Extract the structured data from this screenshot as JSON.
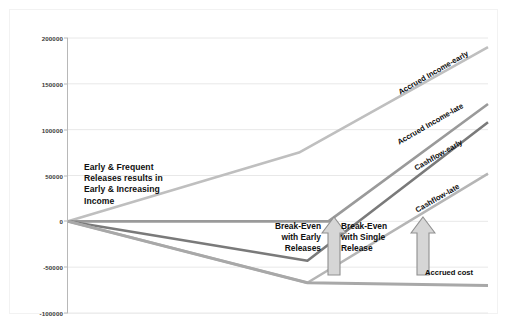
{
  "chart_data": {
    "type": "line",
    "title": "",
    "xlabel": "",
    "ylabel": "",
    "ylim": [
      -100000,
      200000
    ],
    "xlim": [
      0,
      100
    ],
    "grid": true,
    "grid_axis": "y",
    "legend_position": "inline-series-labels",
    "yticks": [
      "200000",
      "150000",
      "100000",
      "50000",
      "0",
      "-50000",
      "-100000"
    ],
    "ytick_values": [
      200000,
      150000,
      100000,
      50000,
      0,
      -50000,
      -100000
    ],
    "series": [
      {
        "name": "Accrued Income-early",
        "color": "#bfbfbf",
        "width": 2.6,
        "x": [
          0,
          55,
          100
        ],
        "values": [
          0,
          75000,
          190000
        ]
      },
      {
        "name": "Accrued Income-late",
        "color": "#9a9a9a",
        "width": 2.6,
        "x": [
          0,
          62,
          100
        ],
        "values": [
          0,
          0,
          128000
        ]
      },
      {
        "name": "Cashflow-early",
        "color": "#7a7a7a",
        "width": 2.6,
        "x": [
          0,
          57,
          100
        ],
        "values": [
          0,
          -43000,
          108000
        ]
      },
      {
        "name": "Cashflow-late",
        "color": "#b5b5b5",
        "width": 2.6,
        "x": [
          0,
          57,
          100
        ],
        "values": [
          0,
          -67000,
          52000
        ]
      },
      {
        "name": "Accrued cost",
        "color": "#a8a8a8",
        "width": 3.0,
        "x": [
          0,
          57,
          100
        ],
        "values": [
          0,
          -67000,
          -70000
        ]
      }
    ],
    "series_labels": [
      {
        "text": "Accrued Income-early",
        "rotation": -30
      },
      {
        "text": "Accrued Income-late",
        "rotation": -30
      },
      {
        "text": "Cashflow-early",
        "rotation": -30
      },
      {
        "text": "Cashflow-late",
        "rotation": -30
      },
      {
        "text": "Accrued cost",
        "rotation": 0
      }
    ],
    "annotations": [
      {
        "text": "Early & Frequent Releases results in Early & Increasing Income"
      },
      {
        "text": "Break-Even with Early Releases"
      },
      {
        "text": "Break-Even with Single Release"
      }
    ]
  },
  "annotation": {
    "line1": "Early & Frequent",
    "line2": "Releases results in",
    "line3": "Early & Increasing",
    "line4": "Income"
  },
  "callouts": {
    "early": {
      "line1": "Break-Even",
      "line2": "with Early",
      "line3": "Releases"
    },
    "single": {
      "line1": "Break-Even",
      "line2": "with Single",
      "line3": "Release"
    }
  },
  "labels": {
    "accrued_income_early": "Accrued Income-early",
    "accrued_income_late": "Accrued Income-late",
    "cashflow_early": "Cashflow-early",
    "cashflow_late": "Cashflow-late",
    "accrued_cost": "Accrued cost"
  },
  "axis": {
    "y0": "200000",
    "y1": "150000",
    "y2": "100000",
    "y3": "50000",
    "y4": "0",
    "y5": "-50000",
    "y6": "-100000"
  },
  "colors": {
    "grid": "#e8e8e8",
    "axis": "#b8b8b8",
    "accrued_income_early": "#bfbfbf",
    "accrued_income_late": "#9a9a9a",
    "cashflow_early": "#7a7a7a",
    "cashflow_late": "#b5b5b5",
    "accrued_cost": "#a8a8a8",
    "arrow_fill": "#d6d6d6",
    "arrow_stroke": "#8f8f8f",
    "text": "#101010"
  }
}
